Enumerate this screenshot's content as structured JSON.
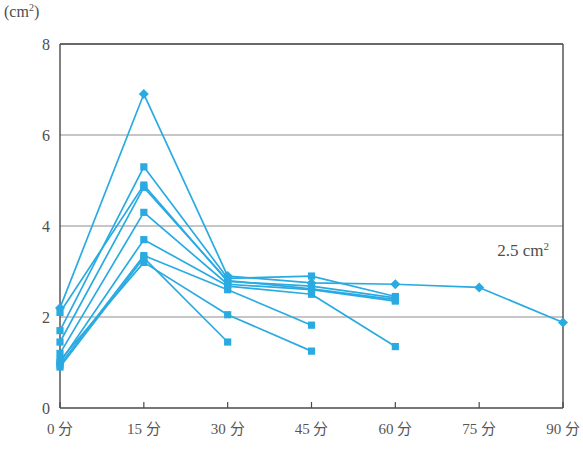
{
  "chart_data": {
    "type": "line",
    "title": "",
    "subtitle": "",
    "ylabel": "(cm2)",
    "ylabel_display": "(cm",
    "ylabel_sup": "2",
    "ylabel_close": ")",
    "xlabel": "",
    "x": [
      0,
      15,
      30,
      45,
      60,
      75,
      90
    ],
    "categories": [
      "0 分",
      "15 分",
      "30 分",
      "45 分",
      "60 分",
      "75 分",
      "90 分"
    ],
    "yticks": [
      0,
      2,
      4,
      6,
      8
    ],
    "ytick_labels": [
      "0",
      "2",
      "4",
      "6",
      "8"
    ],
    "ylim": [
      0,
      8
    ],
    "xlim": [
      0,
      90
    ],
    "grid": "horizontal",
    "legend": "none",
    "series_color": "#29ABE2",
    "annotations": [
      {
        "text": "2.5 cm",
        "sup": "2",
        "x": 75,
        "y": 3.35,
        "name": "value-annotation"
      }
    ],
    "series": [
      {
        "name": "series-1",
        "marker": "diamond",
        "x": [
          0,
          15,
          30,
          45,
          60,
          75,
          90
        ],
        "values": [
          2.2,
          6.9,
          2.9,
          2.75,
          2.72,
          2.65,
          1.88
        ]
      },
      {
        "name": "series-2",
        "marker": "square",
        "x": [
          0,
          15,
          30,
          45,
          60
        ],
        "values": [
          1.7,
          5.3,
          2.85,
          2.9,
          2.45
        ]
      },
      {
        "name": "series-3",
        "marker": "square",
        "x": [
          0,
          15,
          30,
          45,
          60
        ],
        "values": [
          1.45,
          4.85,
          2.8,
          2.62,
          2.38
        ]
      },
      {
        "name": "series-4",
        "marker": "square",
        "x": [
          0,
          15,
          30,
          45,
          60
        ],
        "values": [
          1.2,
          4.3,
          2.72,
          2.6,
          2.35
        ]
      },
      {
        "name": "series-5",
        "marker": "square",
        "x": [
          0,
          15,
          30,
          45,
          60
        ],
        "values": [
          1.0,
          3.7,
          2.68,
          2.5,
          1.35
        ]
      },
      {
        "name": "series-6",
        "marker": "square",
        "x": [
          0,
          15,
          30,
          45
        ],
        "values": [
          0.95,
          3.35,
          2.6,
          1.82
        ]
      },
      {
        "name": "series-7",
        "marker": "square",
        "x": [
          0,
          15,
          30,
          45
        ],
        "values": [
          1.05,
          3.2,
          2.05,
          1.25
        ]
      },
      {
        "name": "series-8",
        "marker": "square",
        "x": [
          0,
          15,
          30
        ],
        "values": [
          0.9,
          3.3,
          1.45
        ]
      },
      {
        "name": "series-9",
        "marker": "square",
        "x": [
          0,
          15,
          30,
          45,
          60
        ],
        "values": [
          2.1,
          4.9,
          2.78,
          2.68,
          2.42
        ]
      }
    ]
  }
}
